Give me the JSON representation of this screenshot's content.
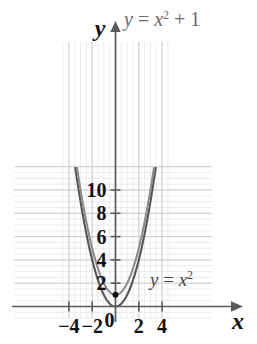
{
  "chart_data": {
    "type": "line",
    "title": "",
    "xlabel": "x",
    "ylabel": "y",
    "xlim": [
      -4.6,
      4.6
    ],
    "ylim": [
      -1.2,
      12.2
    ],
    "grid": true,
    "grid_major_step": 2,
    "grid_minor_step": 0.5,
    "legend_position": "inline-annotations",
    "xticks": [
      -4,
      -2,
      0,
      2,
      4
    ],
    "xtick_labels": [
      "−4",
      "−2",
      "0",
      "2",
      "4"
    ],
    "yticks": [
      2,
      4,
      6,
      8,
      10
    ],
    "ytick_labels": [
      "2",
      "4",
      "6",
      "8",
      "10"
    ],
    "series": [
      {
        "name": "y = x²",
        "color": "#555555",
        "width": 2.1,
        "vertex": [
          0,
          0
        ],
        "coefficients": {
          "a": 1,
          "c": 0
        },
        "points": [
          [
            -3.45,
            11.9
          ],
          [
            -3.0,
            9.0
          ],
          [
            -2.5,
            6.25
          ],
          [
            -2.0,
            4.0
          ],
          [
            -1.5,
            2.25
          ],
          [
            -1.0,
            1.0
          ],
          [
            -0.5,
            0.25
          ],
          [
            0.0,
            0.0
          ],
          [
            0.5,
            0.25
          ],
          [
            1.0,
            1.0
          ],
          [
            1.5,
            2.25
          ],
          [
            2.0,
            4.0
          ],
          [
            2.5,
            6.25
          ],
          [
            3.0,
            9.0
          ],
          [
            3.45,
            11.9
          ]
        ]
      },
      {
        "name": "y = x² + 1",
        "color": "#8c8c8c",
        "width": 2.1,
        "vertex": [
          0,
          1
        ],
        "coefficients": {
          "a": 1,
          "c": 1
        },
        "points": [
          [
            -3.3,
            11.89
          ],
          [
            -3.0,
            10.0
          ],
          [
            -2.5,
            7.25
          ],
          [
            -2.0,
            5.0
          ],
          [
            -1.5,
            3.25
          ],
          [
            -1.0,
            2.0
          ],
          [
            -0.5,
            1.25
          ],
          [
            0.0,
            1.0
          ],
          [
            0.5,
            1.25
          ],
          [
            1.0,
            2.0
          ],
          [
            1.5,
            3.25
          ],
          [
            2.0,
            5.0
          ],
          [
            2.5,
            7.25
          ],
          [
            3.0,
            10.0
          ],
          [
            3.3,
            11.89
          ]
        ]
      }
    ],
    "markers": [
      {
        "name": "vertex-of-x-squared-plus-1",
        "x": 0,
        "y": 1,
        "color": "#111111",
        "r": 3
      }
    ],
    "annotations": [
      {
        "name": "label-x-squared-plus-1",
        "text": "y = x² + 1",
        "parts": {
          "lhs": "y",
          "eq": " = ",
          "var": "x",
          "exp": "2",
          "tail": " + 1"
        },
        "px": 124,
        "py": 26,
        "color": "#8c8c8c"
      },
      {
        "name": "label-x-squared",
        "text": "y = x²",
        "parts": {
          "lhs": "y",
          "eq": " = ",
          "var": "x",
          "exp": "2",
          "tail": ""
        },
        "px": 150,
        "py": 286,
        "color": "#444444"
      }
    ]
  },
  "axes": {
    "x_axis_label": "x",
    "y_axis_label": "y",
    "origin_label": "0"
  },
  "colors": {
    "background": "#ffffff",
    "grid_major": "#c9c9c9",
    "grid_minor": "#e4e4e4",
    "axis": "#5a5a5a",
    "text": "#111111",
    "curve_inner": "#555555",
    "curve_outer": "#8c8c8c"
  }
}
